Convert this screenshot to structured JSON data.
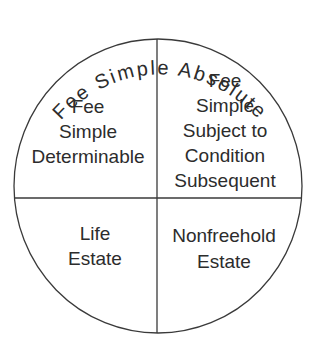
{
  "diagram": {
    "title_arc": "Fee Simple Absolute",
    "quadrants": {
      "top_left": {
        "lines": [
          "Fee",
          "Simple",
          "Determinable"
        ]
      },
      "top_right": {
        "lines": [
          "Fee",
          "Simple",
          "Subject to",
          "Condition",
          "Subsequent"
        ]
      },
      "bottom_left": {
        "lines": [
          "Life",
          "Estate"
        ]
      },
      "bottom_right": {
        "lines": [
          "Nonfreehold",
          "Estate"
        ]
      }
    },
    "colors": {
      "line": "#3a3a3a",
      "text": "#2c2c2c",
      "background": "#ffffff"
    }
  }
}
